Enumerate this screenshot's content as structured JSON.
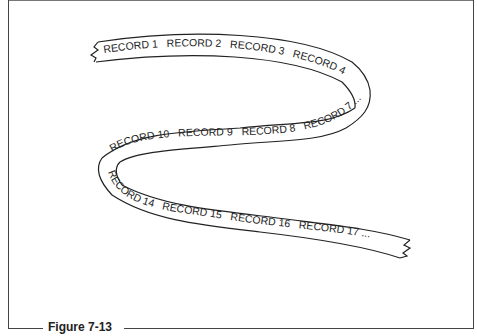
{
  "figure": {
    "caption": "Figure 7-13"
  },
  "ribbon": {
    "segment_top": [
      "RECORD 1",
      "RECORD 2",
      "RECORD 3",
      "RECORD 4"
    ],
    "segment_middle": [
      "RECORD 10",
      "RECORD 9",
      "RECORD 8",
      "RECORD 7"
    ],
    "segment_bottom": [
      "RECORD 14",
      "RECORD 15",
      "RECORD 16",
      "RECORD 17"
    ],
    "continuation": "..."
  },
  "colors": {
    "line": "#222222",
    "background": "#ffffff"
  }
}
